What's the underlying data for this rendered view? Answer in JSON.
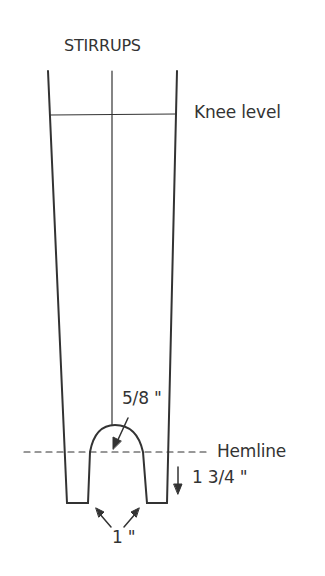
{
  "diagram": {
    "title": "STIRRUPS",
    "labels": {
      "knee": "Knee level",
      "hemline": "Hemline",
      "arc_radius": "5/8 \"",
      "extension": "1 3/4 \"",
      "width": "1 \""
    },
    "colors": {
      "line": "#333333",
      "background": "#ffffff"
    }
  }
}
